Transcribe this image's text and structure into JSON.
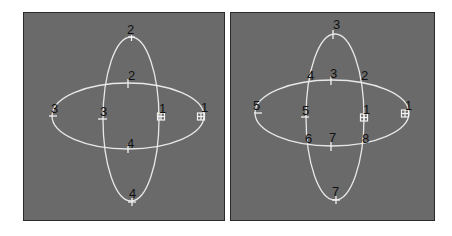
{
  "figure": {
    "background": "#ffffff",
    "panel_background": "#6a6a6a",
    "curve_color": "#e8e8e8",
    "label_color": "#111111"
  },
  "panels": [
    {
      "id": "left",
      "description": "Two intersecting ellipses (vertical and horizontal) with numbered vertices",
      "labels": {
        "v_top": "2",
        "h_top": "2",
        "h_left": "3",
        "v_left": "3",
        "v_right": "1",
        "h_right": "1",
        "h_bottom": "4",
        "v_bottom": "4"
      }
    },
    {
      "id": "right",
      "description": "Same two ellipses with numbered vertices including intersection points",
      "labels": {
        "v_top": "3",
        "x_top_left": "4",
        "h_top": "3",
        "x_top_right": "2",
        "h_left": "5",
        "v_left": "5",
        "v_right": "1",
        "h_right": "1",
        "x_bottom_left": "6",
        "h_bottom": "7",
        "x_bottom_right": "8",
        "v_bottom": "7"
      }
    }
  ]
}
